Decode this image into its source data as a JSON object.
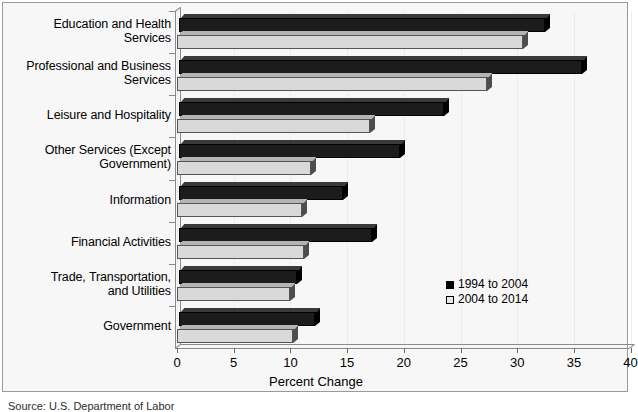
{
  "figure": {
    "source_note": "Source: U.S. Department of Labor"
  },
  "legend": {
    "position": "inside-right",
    "entries": [
      {
        "label": "1994 to 2004",
        "color": "#1c1c1c",
        "swatch": "dark"
      },
      {
        "label": "2004 to 2014",
        "color": "#d9d9d9",
        "swatch": "light"
      }
    ]
  },
  "axis": {
    "x_title": "Percent Change",
    "x_ticks": [
      "0",
      "5",
      "10",
      "15",
      "20",
      "25",
      "30",
      "35",
      "40"
    ],
    "x_min": 0,
    "x_max": 40
  },
  "chart_data": {
    "type": "bar",
    "orientation": "horizontal",
    "title": "",
    "subtitle": "",
    "xlabel": "Percent Change",
    "ylabel": "",
    "xlim": [
      0,
      40
    ],
    "grid": false,
    "legend_position": "inside-right",
    "categories": [
      "Education and Health\nServices",
      "Professional and Business\nServices",
      "Leisure and Hospitality",
      "Other Services (Except\nGovernment)",
      "Information",
      "Financial Activities",
      "Trade, Transportation,\nand Utilities",
      "Government"
    ],
    "series": [
      {
        "name": "1994 to 2004",
        "color": "#1c1c1c",
        "values": [
          32.3,
          35.5,
          23.4,
          19.5,
          14.5,
          17.0,
          10.4,
          12.0
        ]
      },
      {
        "name": "2004 to 2014",
        "color": "#d9d9d9",
        "values": [
          30.5,
          27.3,
          17.0,
          11.8,
          11.0,
          11.2,
          10.0,
          10.2
        ]
      }
    ]
  }
}
